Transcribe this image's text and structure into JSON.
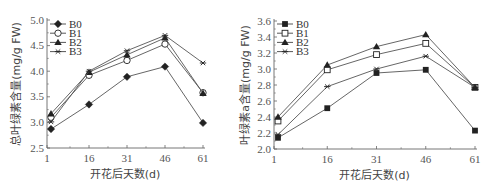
{
  "chart_data": [
    {
      "type": "line",
      "title": "",
      "xlabel": "开花后天数(d)",
      "ylabel": "总叶绿素含量(mg/g FW)",
      "x": [
        1,
        16,
        31,
        46,
        61
      ],
      "xticks": [
        "1",
        "16",
        "31",
        "46",
        "61"
      ],
      "yticks": [
        "2.5",
        "3.0",
        "3.5",
        "4.0",
        "4.5",
        "5.0"
      ],
      "ylim": [
        2.5,
        5.0
      ],
      "xlim": [
        1,
        61
      ],
      "grid": false,
      "legend_position": "upper-left",
      "series": [
        {
          "name": "B0",
          "marker": "filled-diamond",
          "values": [
            2.87,
            3.35,
            3.89,
            4.09,
            2.99
          ]
        },
        {
          "name": "B1",
          "marker": "open-circle",
          "values": [
            3.1,
            3.92,
            4.21,
            4.53,
            3.58
          ]
        },
        {
          "name": "B2",
          "marker": "filled-triangle",
          "values": [
            3.17,
            3.98,
            4.32,
            4.65,
            3.57
          ]
        },
        {
          "name": "B3",
          "marker": "star",
          "values": [
            3.01,
            4.0,
            4.4,
            4.7,
            4.16
          ]
        }
      ]
    },
    {
      "type": "line",
      "title": "",
      "xlabel": "开花后天数(d)",
      "ylabel": "叶绿素a含量(mg/g FW)",
      "x": [
        1,
        16,
        31,
        46,
        61
      ],
      "xticks": [
        "1",
        "16",
        "31",
        "46",
        "61"
      ],
      "yticks": [
        "2.0",
        "2.2",
        "2.4",
        "2.6",
        "2.8",
        "3.0",
        "3.2",
        "3.4",
        "3.6"
      ],
      "ylim": [
        2.0,
        3.6
      ],
      "xlim": [
        1,
        61
      ],
      "grid": false,
      "legend_position": "upper-left",
      "series": [
        {
          "name": "B0",
          "marker": "filled-square",
          "values": [
            2.14,
            2.51,
            2.95,
            2.99,
            2.23
          ]
        },
        {
          "name": "B1",
          "marker": "open-square",
          "values": [
            2.35,
            2.99,
            3.18,
            3.32,
            2.77
          ]
        },
        {
          "name": "B2",
          "marker": "filled-triangle",
          "values": [
            2.4,
            3.05,
            3.28,
            3.43,
            2.77
          ]
        },
        {
          "name": "B3",
          "marker": "star",
          "values": [
            2.18,
            2.78,
            3.0,
            3.16,
            2.77
          ]
        }
      ]
    }
  ]
}
